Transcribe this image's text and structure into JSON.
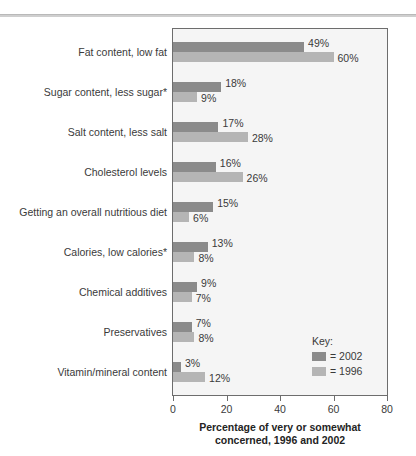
{
  "chart_data": {
    "type": "bar",
    "orientation": "horizontal",
    "title": "",
    "xlabel": "Percentage of very or somewhat concerned, 1996 and 2002",
    "xlabel_lines": [
      "Percentage of very or somewhat",
      "concerned, 1996 and 2002"
    ],
    "ylabel": "",
    "xlim": [
      0,
      80
    ],
    "xticks": [
      0,
      20,
      40,
      60,
      80
    ],
    "xticklabels": [
      "0",
      "20",
      "40",
      "60",
      "80"
    ],
    "grid": false,
    "legend_position": "inside-bottom-right",
    "legend_title": "Key:",
    "categories": [
      "Fat content, low fat",
      "Sugar content, less sugar*",
      "Salt content, less salt",
      "Cholesterol levels",
      "Getting an overall nutritious diet",
      "Calories, low calories*",
      "Chemical additives",
      "Preservatives",
      "Vitamin/mineral content"
    ],
    "series": [
      {
        "name": "2002",
        "legend_label": "= 2002",
        "color": "#8b8b8b",
        "values": [
          49,
          18,
          17,
          16,
          15,
          13,
          9,
          7,
          3
        ],
        "value_labels": [
          "49%",
          "18%",
          "17%",
          "16%",
          "15%",
          "13%",
          "9%",
          "7%",
          "3%"
        ]
      },
      {
        "name": "1996",
        "legend_label": "= 1996",
        "color": "#b5b5b5",
        "values": [
          60,
          9,
          28,
          26,
          6,
          8,
          7,
          8,
          12
        ],
        "value_labels": [
          "60%",
          "9%",
          "28%",
          "26%",
          "6%",
          "8%",
          "7%",
          "8%",
          "12%"
        ]
      }
    ]
  },
  "colors": {
    "series_2002": "#8b8b8b",
    "series_1996": "#b5b5b5",
    "plot_background": "#f5f5f5",
    "frame": "#6d6d6d",
    "text": "#3a3a3a"
  }
}
